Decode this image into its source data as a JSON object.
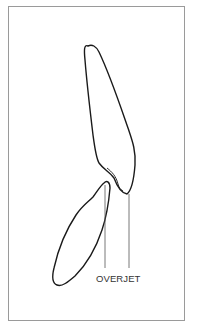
{
  "diagram": {
    "label": "OVERJET",
    "colors": {
      "border": "#9a9a9a",
      "outline": "#1a1a1a",
      "guide": "#555555"
    }
  }
}
